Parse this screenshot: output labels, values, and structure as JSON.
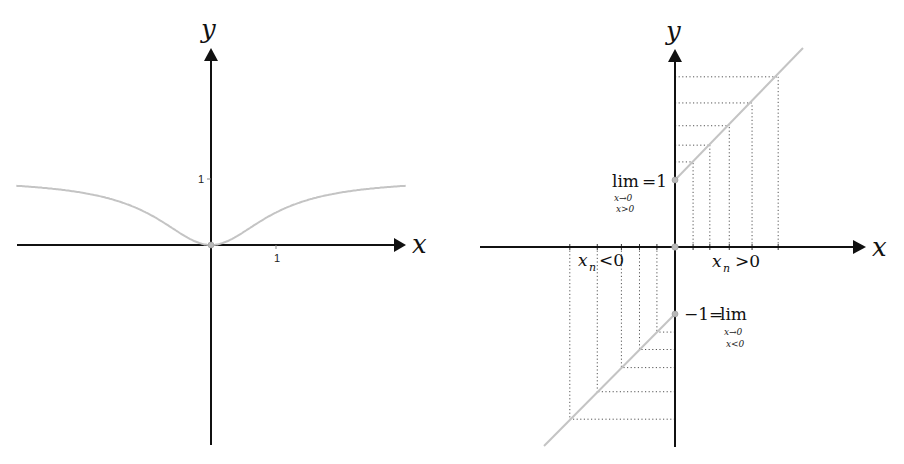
{
  "chart_data": [
    {
      "type": "line",
      "title": "",
      "function": "y = x^2 / (1 + x^2)",
      "xlabel": "x",
      "ylabel": "y",
      "xlim": [
        -2.95,
        2.95
      ],
      "ylim": [
        -3.0,
        3.4
      ],
      "x_ticks": [
        {
          "value": 1,
          "label": "1"
        }
      ],
      "y_ticks": [
        {
          "value": 1,
          "label": "1"
        }
      ],
      "grid": false,
      "series": [
        {
          "name": "f(x)",
          "x": [
            -2.95,
            -2,
            -1.5,
            -1,
            -0.5,
            0,
            0.5,
            1,
            1.5,
            2,
            2.95
          ],
          "y": [
            0.897,
            0.8,
            0.692,
            0.5,
            0.2,
            0,
            0.2,
            0.5,
            0.692,
            0.8,
            0.897
          ]
        }
      ],
      "highlighted_points": [
        {
          "x": 0,
          "y": 0
        }
      ]
    },
    {
      "type": "line",
      "title": "",
      "xlabel": "x",
      "ylabel": "y",
      "xlim": [
        -2.9,
        2.8
      ],
      "ylim": [
        -3.0,
        3.4
      ],
      "grid": false,
      "series": [
        {
          "name": "x > 0 branch",
          "function": "y = x + 1",
          "x": [
            0,
            1.93
          ],
          "y": [
            1,
            2.93
          ]
        },
        {
          "name": "x < 0 branch",
          "function": "y = x - 1",
          "x": [
            -1.94,
            0
          ],
          "y": [
            -2.94,
            -1
          ]
        }
      ],
      "sequence_points_positive": [
        {
          "x": 0.27,
          "y": 1.27
        },
        {
          "x": 0.52,
          "y": 1.52
        },
        {
          "x": 0.81,
          "y": 1.81
        },
        {
          "x": 1.15,
          "y": 2.15
        },
        {
          "x": 1.54,
          "y": 2.54
        }
      ],
      "sequence_points_negative": [
        {
          "x": -0.27,
          "y": -1.27
        },
        {
          "x": -0.53,
          "y": -1.53
        },
        {
          "x": -0.8,
          "y": -1.8
        },
        {
          "x": -1.16,
          "y": -2.16
        },
        {
          "x": -1.57,
          "y": -2.57
        }
      ],
      "highlighted_points": [
        {
          "x": 0,
          "y": 1
        },
        {
          "x": 0,
          "y": -1
        },
        {
          "x": 0,
          "y": 0
        }
      ],
      "annotations": [
        {
          "text": "lim_{x→0, x>0} = 1",
          "at": {
            "x": 0,
            "y": 1
          }
        },
        {
          "text": "-1 = lim_{x→0, x<0}",
          "at": {
            "x": 0,
            "y": -1
          }
        },
        {
          "text": "x_n < 0"
        },
        {
          "text": "x_n > 0"
        }
      ]
    }
  ],
  "left": {
    "x_label": "x",
    "y_label": "y",
    "x_tick": "1",
    "y_tick": "1"
  },
  "right": {
    "x_label": "x",
    "y_label": "y",
    "upper_lim": {
      "lim": "lim",
      "eq": "=1",
      "sub1": "x→0",
      "sub2": "x>0"
    },
    "lower_lim": {
      "pre": "−1=",
      "lim": "lim",
      "sub1": "x→0",
      "sub2": "x<0"
    },
    "neg_label": {
      "x": "x",
      "n": "n",
      "rel": "<0"
    },
    "pos_label": {
      "x": "x",
      "n": "n",
      "rel": ">0"
    }
  },
  "colors": {
    "axis": "#111111",
    "curve": "#c4c4c4",
    "dotted": "#555555",
    "point": "#b8b8b8"
  }
}
